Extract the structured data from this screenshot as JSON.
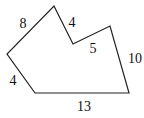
{
  "diagram": {
    "type": "polygon",
    "vertices": [
      [
        54,
        6
      ],
      [
        73,
        44
      ],
      [
        110,
        26
      ],
      [
        129,
        93
      ],
      [
        35,
        93
      ],
      [
        7,
        54
      ]
    ],
    "stroke": "#222222",
    "side_labels": [
      {
        "text": "8",
        "x": 23,
        "y": 28,
        "anchor": "middle"
      },
      {
        "text": "4",
        "x": 72,
        "y": 27,
        "anchor": "middle"
      },
      {
        "text": "5",
        "x": 93,
        "y": 53,
        "anchor": "middle"
      },
      {
        "text": "10",
        "x": 135,
        "y": 63,
        "anchor": "middle"
      },
      {
        "text": "4",
        "x": 13,
        "y": 85,
        "anchor": "middle"
      },
      {
        "text": "13",
        "x": 84,
        "y": 111,
        "anchor": "middle"
      }
    ]
  }
}
